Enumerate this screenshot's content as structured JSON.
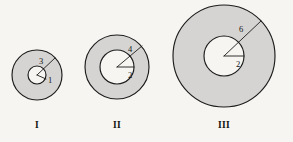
{
  "figure": {
    "background_color": "#f6f5f1",
    "annulus_fill_color": "#d5d4d2",
    "hole_fill_color": "#f6f5f1",
    "stroke_color": "#1c1c1c",
    "panels": [
      {
        "caption": "I",
        "caption_x": 37,
        "caption_y": 128,
        "center_x": 37,
        "center_y": 75,
        "outer_radius_px": 25,
        "inner_radius_px": 9,
        "outer_radius_label": "3",
        "inner_radius_label": "1",
        "outer_label_x": 39,
        "outer_label_y": 64,
        "inner_label_x": 48,
        "inner_label_y": 83,
        "outer_line": {
          "x1": 37,
          "y1": 75,
          "x2": 55,
          "y2": 58
        },
        "inner_line": {
          "x1": 37,
          "y1": 75,
          "x2": 46,
          "y2": 79
        }
      },
      {
        "caption": "II",
        "caption_x": 117,
        "caption_y": 128,
        "center_x": 117,
        "center_y": 67,
        "outer_radius_px": 32,
        "inner_radius_px": 17,
        "outer_radius_label": "4",
        "inner_radius_label": "2",
        "outer_label_x": 128,
        "outer_label_y": 52,
        "inner_label_x": 128,
        "inner_label_y": 78,
        "outer_line": {
          "x1": 117,
          "y1": 67,
          "x2": 142,
          "y2": 46
        },
        "inner_line": {
          "x1": 117,
          "y1": 67,
          "x2": 134,
          "y2": 67
        }
      },
      {
        "caption": "III",
        "caption_x": 224,
        "caption_y": 128,
        "center_x": 224,
        "center_y": 56,
        "outer_radius_px": 51,
        "inner_radius_px": 20,
        "outer_radius_label": "6",
        "inner_radius_label": "2",
        "outer_label_x": 239,
        "outer_label_y": 32,
        "inner_label_x": 236,
        "inner_label_y": 67,
        "outer_line": {
          "x1": 224,
          "y1": 56,
          "x2": 261,
          "y2": 21
        },
        "inner_line": {
          "x1": 224,
          "y1": 56,
          "x2": 244,
          "y2": 56
        }
      }
    ]
  }
}
